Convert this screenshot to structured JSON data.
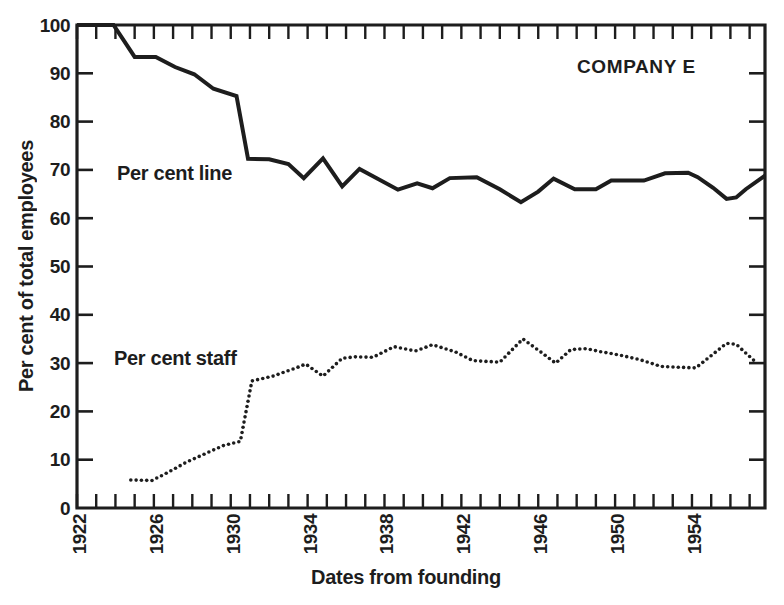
{
  "chart_data": {
    "type": "line",
    "title": "COMPANY E",
    "xlabel": "Dates from founding",
    "ylabel": "Per cent of total employees",
    "xlim": [
      1922,
      1957.8
    ],
    "ylim": [
      0,
      100
    ],
    "grid": false,
    "x_tick_interval_years": 1,
    "x_tick_labels": [
      "1922",
      "1926",
      "1930",
      "1934",
      "1938",
      "1942",
      "1946",
      "1950",
      "1954"
    ],
    "x_tick_label_years": [
      1922,
      1926,
      1930,
      1934,
      1938,
      1942,
      1946,
      1950,
      1954
    ],
    "y_ticks": [
      0,
      10,
      20,
      30,
      40,
      50,
      60,
      70,
      80,
      90,
      100
    ],
    "y_tick_labels": [
      "0",
      "10",
      "20",
      "30",
      "40",
      "50",
      "60",
      "70",
      "80",
      "90",
      "100"
    ],
    "legend_position": "inline-annotations",
    "ink_color": "#1d1d1d",
    "background_color": "#ffffff",
    "series": [
      {
        "name": "Per cent line",
        "style": "solid",
        "points": [
          [
            1922.0,
            100
          ],
          [
            1923.9,
            100
          ],
          [
            1925.0,
            93.4
          ],
          [
            1926.1,
            93.4
          ],
          [
            1927.1,
            91.3
          ],
          [
            1928.1,
            89.8
          ],
          [
            1929.1,
            86.8
          ],
          [
            1930.3,
            85.3
          ],
          [
            1930.9,
            72.3
          ],
          [
            1932.0,
            72.2
          ],
          [
            1933.0,
            71.2
          ],
          [
            1933.8,
            68.3
          ],
          [
            1934.8,
            72.4
          ],
          [
            1935.8,
            66.6
          ],
          [
            1936.7,
            70.2
          ],
          [
            1938.7,
            65.9
          ],
          [
            1939.7,
            67.2
          ],
          [
            1940.5,
            66.2
          ],
          [
            1941.4,
            68.3
          ],
          [
            1942.8,
            68.5
          ],
          [
            1944.0,
            66.0
          ],
          [
            1945.1,
            63.3
          ],
          [
            1946.0,
            65.5
          ],
          [
            1946.8,
            68.2
          ],
          [
            1947.9,
            66.0
          ],
          [
            1949.0,
            66.0
          ],
          [
            1949.8,
            67.8
          ],
          [
            1951.5,
            67.8
          ],
          [
            1952.6,
            69.3
          ],
          [
            1953.8,
            69.4
          ],
          [
            1954.3,
            68.5
          ],
          [
            1955.1,
            66.3
          ],
          [
            1955.8,
            64.0
          ],
          [
            1956.3,
            64.3
          ],
          [
            1956.8,
            66.0
          ],
          [
            1957.8,
            68.8
          ]
        ]
      },
      {
        "name": "Per cent staff",
        "style": "dotted",
        "points": [
          [
            1924.8,
            5.8
          ],
          [
            1925.9,
            5.7
          ],
          [
            1926.7,
            7.3
          ],
          [
            1927.7,
            9.5
          ],
          [
            1928.7,
            11.3
          ],
          [
            1929.6,
            12.9
          ],
          [
            1930.5,
            13.8
          ],
          [
            1931.1,
            26.3
          ],
          [
            1932.2,
            27.3
          ],
          [
            1933.4,
            29.0
          ],
          [
            1933.9,
            29.8
          ],
          [
            1934.8,
            27.3
          ],
          [
            1935.8,
            31.0
          ],
          [
            1936.5,
            31.3
          ],
          [
            1937.4,
            31.2
          ],
          [
            1938.5,
            33.4
          ],
          [
            1939.6,
            32.5
          ],
          [
            1940.5,
            33.8
          ],
          [
            1941.7,
            32.3
          ],
          [
            1942.6,
            30.5
          ],
          [
            1944.0,
            30.2
          ],
          [
            1945.2,
            35.0
          ],
          [
            1946.1,
            32.4
          ],
          [
            1946.9,
            30.0
          ],
          [
            1947.7,
            32.8
          ],
          [
            1948.5,
            33.0
          ],
          [
            1949.2,
            32.4
          ],
          [
            1950.2,
            31.7
          ],
          [
            1951.3,
            30.7
          ],
          [
            1952.4,
            29.3
          ],
          [
            1954.2,
            29.0
          ],
          [
            1955.8,
            34.1
          ],
          [
            1956.3,
            33.9
          ],
          [
            1957.4,
            29.9
          ]
        ]
      }
    ]
  }
}
